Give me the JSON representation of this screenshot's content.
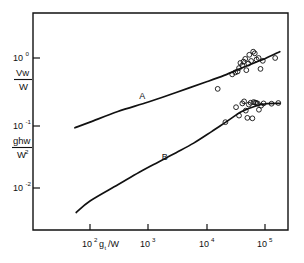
{
  "chart_data": {
    "type": "line",
    "title": "",
    "subtitle": "",
    "xlabel": "g t / W",
    "xlabel_parts": {
      "base": "g",
      "sub": "t",
      "tail": "/W"
    },
    "ylabel": "",
    "xscale": "log",
    "yscale": "log",
    "xlim": [
      30,
      200000
    ],
    "ylim": [
      0.0035,
      2.2
    ],
    "grid": false,
    "legend": "none",
    "xticks": [
      100,
      1000,
      10000,
      100000
    ],
    "xtick_labels": [
      "10²",
      "10³",
      "10⁴",
      "10⁵"
    ],
    "xtick_mantissas": [
      "10",
      "10",
      "10",
      "10"
    ],
    "xtick_exponents": [
      "2",
      "3",
      "4",
      "5"
    ],
    "yticks": [
      1,
      0.1,
      0.01
    ],
    "ytick_labels": [
      "10⁰",
      "10⁻¹",
      "10⁻²"
    ],
    "ytick_mantissas": [
      "10",
      "10",
      "10"
    ],
    "ytick_exponents": [
      "0",
      "-1",
      "-2"
    ],
    "y_axis_quantities": [
      {
        "at_tick": "10⁰",
        "numerator": "Vw",
        "denominator": "W",
        "description": "Vw over W"
      },
      {
        "at_tick": "10⁻¹",
        "numerator": "ghw",
        "denominator": "W²",
        "denominator_base": "W",
        "denominator_exp": "2",
        "description": "g h w over W squared"
      }
    ],
    "annotations": [
      {
        "text": "A",
        "x": 700,
        "y": 0.235,
        "curve": "A"
      },
      {
        "text": "B",
        "x": 1700,
        "y": 0.0265,
        "curve": "B"
      }
    ],
    "series": [
      {
        "name": "A",
        "label": "A",
        "type": "line",
        "points": [
          [
            55,
            0.0845
          ],
          [
            100,
            0.103
          ],
          [
            300,
            0.15
          ],
          [
            1000,
            0.21
          ],
          [
            3000,
            0.295
          ],
          [
            10000,
            0.43
          ],
          [
            20000,
            0.54
          ],
          [
            40000,
            0.7
          ],
          [
            70000,
            0.86
          ],
          [
            100000,
            0.975
          ],
          [
            180000,
            1.25
          ]
        ]
      },
      {
        "name": "B",
        "label": "B",
        "type": "line",
        "points": [
          [
            58,
            0.0042
          ],
          [
            100,
            0.0063
          ],
          [
            300,
            0.0112
          ],
          [
            700,
            0.0175
          ],
          [
            1500,
            0.0252
          ],
          [
            3000,
            0.035
          ],
          [
            6000,
            0.049
          ],
          [
            12000,
            0.073
          ],
          [
            22000,
            0.105
          ],
          [
            40000,
            0.15
          ],
          [
            70000,
            0.183
          ],
          [
            110000,
            0.198
          ],
          [
            180000,
            0.2
          ]
        ]
      }
    ],
    "scatter_groups": [
      {
        "name": "Vw/W data",
        "related_curve": "A",
        "marker": "open-circle",
        "points": [
          [
            15500,
            0.335
          ],
          [
            27500,
            0.56
          ],
          [
            31000,
            0.6
          ],
          [
            34000,
            0.62
          ],
          [
            36000,
            0.7
          ],
          [
            38000,
            0.84
          ],
          [
            41000,
            0.77
          ],
          [
            43000,
            0.88
          ],
          [
            46000,
            0.97
          ],
          [
            48000,
            0.65
          ],
          [
            52000,
            0.82
          ],
          [
            54000,
            1.12
          ],
          [
            58000,
            0.9
          ],
          [
            63000,
            1.25
          ],
          [
            67000,
            1.18
          ],
          [
            72000,
            0.95
          ],
          [
            78000,
            1.0
          ],
          [
            84000,
            0.68
          ],
          [
            92000,
            0.905
          ],
          [
            150000,
            1.0
          ]
        ]
      },
      {
        "name": "ghw/W² data",
        "related_curve": "B",
        "marker": "open-circle",
        "points": [
          [
            21000,
            0.103
          ],
          [
            32000,
            0.175
          ],
          [
            36000,
            0.13
          ],
          [
            41000,
            0.2
          ],
          [
            44000,
            0.215
          ],
          [
            47000,
            0.155
          ],
          [
            50000,
            0.12
          ],
          [
            53000,
            0.192
          ],
          [
            57000,
            0.205
          ],
          [
            61000,
            0.118
          ],
          [
            64000,
            0.21
          ],
          [
            68000,
            0.206
          ],
          [
            71000,
            0.203
          ],
          [
            75000,
            0.2
          ],
          [
            79000,
            0.16
          ],
          [
            86000,
            0.185
          ],
          [
            95000,
            0.2
          ],
          [
            130000,
            0.198
          ],
          [
            170000,
            0.203
          ]
        ]
      }
    ]
  },
  "figure": {
    "background_color": "#ffffff",
    "ink_color": "#111111"
  }
}
